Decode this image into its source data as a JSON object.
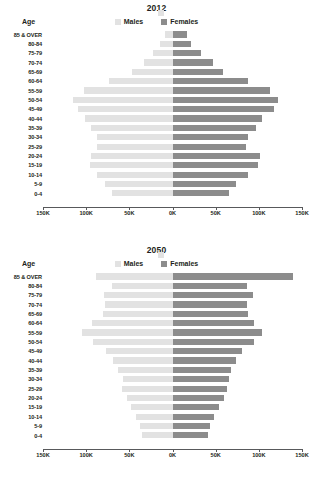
{
  "charts": [
    {
      "title": "2012",
      "age_axis_label": "Age",
      "legend": [
        {
          "label": "Males",
          "color": "#e2e2e2",
          "key": "males"
        },
        {
          "label": "Females",
          "color": "#8c8c8c",
          "key": "females"
        }
      ],
      "xticks": [
        "150K",
        "100K",
        "50K",
        "0K",
        "50K",
        "100K",
        "150K"
      ],
      "chart_data": {
        "type": "bar",
        "subtype": "population-pyramid",
        "title": "2012",
        "xlabel": "",
        "ylabel": "Age",
        "xlim": [
          -150000,
          150000
        ],
        "xtick_values": [
          -150000,
          -100000,
          -50000,
          0,
          50000,
          100000,
          150000
        ],
        "xtick_labels": [
          "150K",
          "100K",
          "50K",
          "0K",
          "50K",
          "100K",
          "150K"
        ],
        "grid": false,
        "legend_position": "top-center",
        "categories": [
          "85 & OVER",
          "80-84",
          "75-79",
          "70-74",
          "65-69",
          "60-64",
          "55-59",
          "50-54",
          "45-49",
          "40-44",
          "35-39",
          "30-34",
          "25-29",
          "20-24",
          "15-19",
          "10-14",
          "5-9",
          "0-4"
        ],
        "series": [
          {
            "name": "Males",
            "color": "#e2e2e2",
            "values": [
              9000,
              14000,
              23000,
              33000,
              47000,
              74000,
              103000,
              115000,
              110000,
              101000,
              94000,
              88000,
              87000,
              94000,
              96000,
              88000,
              78000,
              70000
            ]
          },
          {
            "name": "Females",
            "color": "#8c8c8c",
            "values": [
              17000,
              22000,
              33000,
              47000,
              58000,
              88000,
              113000,
              122000,
              118000,
              104000,
              97000,
              88000,
              85000,
              101000,
              99000,
              87000,
              74000,
              66000
            ]
          }
        ]
      }
    },
    {
      "title": "2050",
      "age_axis_label": "Age",
      "legend": [
        {
          "label": "Males",
          "color": "#e2e2e2",
          "key": "males"
        },
        {
          "label": "Females",
          "color": "#8c8c8c",
          "key": "females"
        }
      ],
      "xticks": [
        "150K",
        "100K",
        "50K",
        "0K",
        "50K",
        "100K",
        "150K"
      ],
      "chart_data": {
        "type": "bar",
        "subtype": "population-pyramid",
        "title": "2050",
        "xlabel": "",
        "ylabel": "Age",
        "xlim": [
          -150000,
          150000
        ],
        "xtick_values": [
          -150000,
          -100000,
          -50000,
          0,
          50000,
          100000,
          150000
        ],
        "xtick_labels": [
          "150K",
          "100K",
          "50K",
          "0K",
          "50K",
          "100K",
          "150K"
        ],
        "grid": false,
        "legend_position": "top-center",
        "categories": [
          "85 & OVER",
          "80-84",
          "75-79",
          "70-74",
          "65-69",
          "60-64",
          "55-59",
          "50-54",
          "45-49",
          "40-44",
          "35-39",
          "30-34",
          "25-29",
          "20-24",
          "15-19",
          "10-14",
          "5-9",
          "0-4"
        ],
        "series": [
          {
            "name": "Males",
            "color": "#e2e2e2",
            "values": [
              89000,
              70000,
              79000,
              78000,
              81000,
              93000,
              105000,
              92000,
              77000,
              69000,
              63000,
              57000,
              58000,
              53000,
              48000,
              42000,
              38000,
              35000
            ]
          },
          {
            "name": "Females",
            "color": "#8c8c8c",
            "values": [
              140000,
              86000,
              93000,
              86000,
              87000,
              94000,
              104000,
              94000,
              80000,
              74000,
              68000,
              65000,
              63000,
              60000,
              54000,
              48000,
              44000,
              41000
            ]
          }
        ]
      }
    }
  ]
}
